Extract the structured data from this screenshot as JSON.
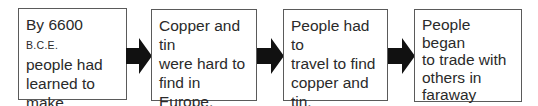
{
  "flowchart": {
    "steps": [
      {
        "pre": "By 6600 ",
        "era": "B.C.E.",
        "post": "\npeople had\nlearned to\nmake bronze."
      },
      {
        "text": "Copper and tin\nwere hard to\nfind in Europe."
      },
      {
        "text": "People had to\ntravel to find\ncopper and tin."
      },
      {
        "text": "People began\nto trade with\nothers in\nfaraway\nplaces."
      }
    ],
    "arrow_color": "#111111",
    "border_color": "#5a5a5a"
  }
}
